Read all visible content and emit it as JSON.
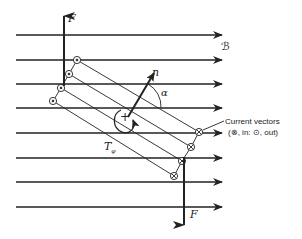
{
  "figure": {
    "field_label": "ℬ",
    "force_label_top": "F",
    "force_label_bottom": "F",
    "normal_label": "n",
    "angle_label": "α",
    "torque_label": "T",
    "torque_subscript": "φ",
    "rotation_sign": "+",
    "annotation": {
      "line1": "Current vectors",
      "line2": "(⊗, in: ⊙, out)"
    }
  },
  "field_lines_y": [
    35,
    60,
    84,
    108,
    133,
    158,
    182,
    207
  ],
  "colors": {
    "ink": "#222222",
    "background": "#ffffff"
  }
}
